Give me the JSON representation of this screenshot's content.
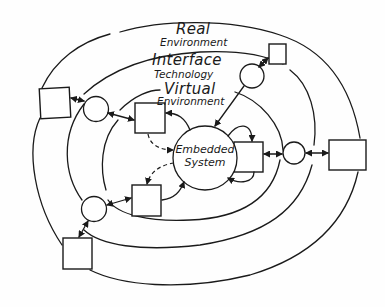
{
  "diagram": {
    "layers": [
      {
        "name": "real_environment",
        "line1": "Real",
        "line2": "Environment"
      },
      {
        "name": "interface_technology",
        "line1": "Interface",
        "line2": "Technology"
      },
      {
        "name": "virtual_environment",
        "line1": "Virtual",
        "line2": "Environment"
      }
    ],
    "core": {
      "line1": "Embedded",
      "line2": "System"
    },
    "colors": {
      "ink": "#1a1a1a",
      "background": "#fefefe"
    }
  }
}
